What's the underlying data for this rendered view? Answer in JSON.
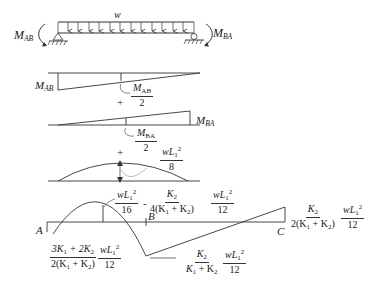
{
  "beam": {
    "load_label": "w",
    "left_moment": {
      "main": "M",
      "sub": "AB"
    },
    "right_moment": {
      "main": "M",
      "sub": "BA"
    }
  },
  "diagram1": {
    "end_label": {
      "main": "M",
      "sub": "AB"
    },
    "mid_fraction": {
      "num": "M",
      "num_sub": "AB",
      "den": "2"
    }
  },
  "plus1": "+",
  "diagram2": {
    "end_label": {
      "main": "M",
      "sub": "BA"
    },
    "mid_fraction": {
      "num": "M",
      "num_sub": "BA",
      "den": "2"
    }
  },
  "plus2": "+",
  "diagram3": {
    "mid_fraction": {
      "num": "wL",
      "num_sub": "1",
      "num_sup": "2",
      "den": "8"
    }
  },
  "combined": {
    "label_A": "A",
    "label_B": "B",
    "label_C": "C",
    "top_expr": {
      "f1": {
        "num": "wL",
        "num_sub": "1",
        "num_sup": "2",
        "den": "16"
      },
      "op": "-",
      "f2": {
        "num": "K",
        "num_sub": "2",
        "den": "4(K",
        "den_sub1": "1",
        "den_mid": " + K",
        "den_sub2": "2",
        "den_end": ")"
      },
      "f3": {
        "num": "wL",
        "num_sub": "1",
        "num_sup": "2",
        "den": "12"
      }
    },
    "left_expr": {
      "f1": {
        "num_a": "3K",
        "num_sub1": "1",
        "num_mid": " + 2K",
        "num_sub2": "2",
        "den": "2(K",
        "den_sub1": "1",
        "den_mid": " + K",
        "den_sub2": "2",
        "den_end": ")"
      },
      "f2": {
        "num": "wL",
        "num_sub": "1",
        "num_sup": "2",
        "den": "12"
      }
    },
    "bottom_expr": {
      "f1": {
        "num": "K",
        "num_sub": "2",
        "den": "K",
        "den_sub1": "1",
        "den_mid": " + K",
        "den_sub2": "2"
      },
      "f2": {
        "num": "wL",
        "num_sub": "1",
        "num_sup": "2",
        "den": "12"
      }
    },
    "right_expr": {
      "f1": {
        "num": "K",
        "num_sub": "2",
        "den": "2(K",
        "den_sub1": "1",
        "den_mid": " + K",
        "den_sub2": "2",
        "den_end": ")"
      },
      "f2": {
        "num": "wL",
        "num_sub": "1",
        "num_sup": "2",
        "den": "12"
      }
    }
  }
}
